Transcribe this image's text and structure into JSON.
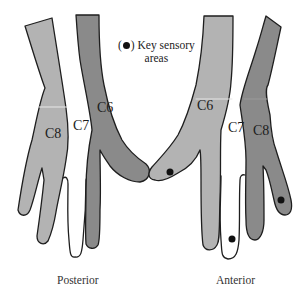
{
  "figure": {
    "colors": {
      "light_gray": "#b3b3b3",
      "dark_gray": "#8a8a8a",
      "white": "#ffffff",
      "outline": "#1e1e1e",
      "dot": "#111111"
    },
    "legend": {
      "marker_open": "(",
      "marker_close": ")",
      "line1": "Key sensory",
      "line2": "areas"
    },
    "posterior": {
      "caption": "Posterior",
      "regions": [
        {
          "label": "C8",
          "color": "light_gray"
        },
        {
          "label": "C7",
          "color": "white"
        },
        {
          "label": "C6",
          "color": "dark_gray"
        }
      ]
    },
    "anterior": {
      "caption": "Anterior",
      "regions": [
        {
          "label": "C6",
          "color": "light_gray"
        },
        {
          "label": "C7",
          "color": "white"
        },
        {
          "label": "C8",
          "color": "dark_gray"
        }
      ],
      "key_sensory_dots": [
        {
          "region": "C6",
          "location": "thumb tip"
        },
        {
          "region": "C7",
          "location": "middle finger tip"
        },
        {
          "region": "C8",
          "location": "little finger tip"
        }
      ]
    }
  }
}
